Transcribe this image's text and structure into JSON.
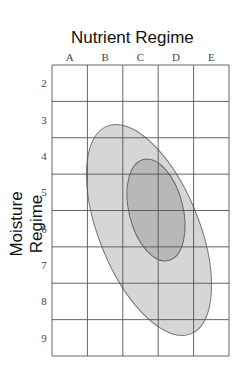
{
  "chart_data": {
    "type": "edatopic-grid",
    "title": "Nutrient Regime",
    "xlabel": "Nutrient Regime",
    "ylabel": "Moisture Regime",
    "x_categories": [
      "A",
      "B",
      "C",
      "D",
      "E"
    ],
    "y_categories": [
      "2",
      "3",
      "4",
      "5",
      "6",
      "7",
      "8",
      "9"
    ],
    "grid": true,
    "regions": [
      {
        "name": "outer",
        "description": "Broad range ellipse",
        "x_range": [
          "B",
          "D"
        ],
        "y_range": [
          "3",
          "9"
        ],
        "fill": "#d4d4d4"
      },
      {
        "name": "inner",
        "description": "Optimal range ellipse",
        "x_range": [
          "C",
          "D"
        ],
        "y_range": [
          "4",
          "7"
        ],
        "fill": "#b4b4b4"
      }
    ]
  }
}
